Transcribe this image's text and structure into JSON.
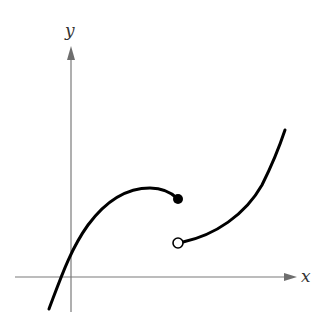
{
  "figure": {
    "type": "piecewise function graph with jump discontinuity",
    "axes": {
      "x_label": "x",
      "y_label": "y"
    },
    "left_piece": {
      "description": "concave-down curve rising from lower-left, peaking, then ending at a closed (filled) point",
      "endpoint": "closed"
    },
    "right_piece": {
      "description": "concave-up curve starting at an open point below the closed point and rising to the upper-right",
      "endpoint": "open"
    },
    "colors": {
      "curve": "#000000",
      "axis": "#7a7a7a",
      "open_point_fill": "#ffffff",
      "closed_point_fill": "#000000"
    }
  }
}
